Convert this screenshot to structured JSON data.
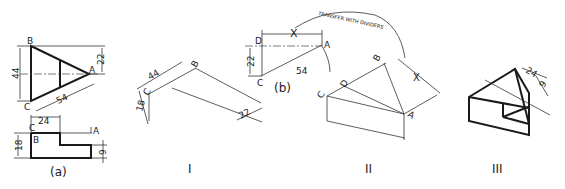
{
  "figure_labels": {
    "a": "(a)",
    "b": "(b)",
    "step1": "I",
    "step2": "II",
    "step3": "III"
  },
  "view_a": {
    "top_view": {
      "vertices": [
        "A",
        "B",
        "C"
      ],
      "dims": {
        "height": "44",
        "half_height": "22",
        "length": "54"
      }
    },
    "front_view": {
      "vertices": [
        "C",
        "B",
        "A"
      ],
      "dims": {
        "width": "24",
        "height": "18",
        "step": "9"
      }
    }
  },
  "step_I": {
    "vertices": [
      "C",
      "B"
    ],
    "dims": {
      "d44": "44",
      "d18": "18",
      "d22": "22"
    }
  },
  "view_b": {
    "vertices": [
      "D",
      "A",
      "C"
    ],
    "dims": {
      "x": "X",
      "d22": "22",
      "d54": "54"
    },
    "annotation": "TRANSFER WITH DIVIDERS"
  },
  "step_II": {
    "vertices": [
      "C",
      "D",
      "B",
      "A",
      "X"
    ]
  },
  "step_III": {
    "dims": {
      "d24": "24",
      "d9": "9"
    }
  }
}
